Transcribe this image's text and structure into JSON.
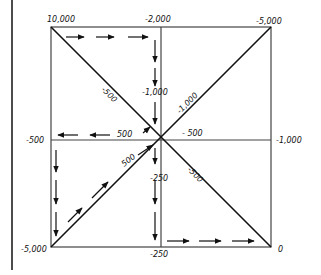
{
  "diagram": {
    "type": "gain-scheduling / value-path grid",
    "corners": {
      "top_left": "10,000",
      "top_right": "-5,000",
      "bottom_left": "-5,000",
      "bottom_right": "0"
    },
    "edge_midpoints": {
      "top": "-2,000",
      "left": "-500",
      "right": "-1,000",
      "bottom": "-250"
    },
    "center_axis_labels": {
      "upper_vertical": "-1,000",
      "lower_vertical": "-250",
      "left_horizontal": "500",
      "right_horizontal": "- 500"
    },
    "diagonal_labels": {
      "top_left": "-500",
      "top_right": "-1,000",
      "bottom_left": "500",
      "bottom_right": "-500"
    },
    "arrow_paths": [
      {
        "name": "top-edge-right",
        "direction": "right",
        "count": 3
      },
      {
        "name": "center-vertical-upper-down",
        "direction": "down",
        "count": 3
      },
      {
        "name": "center-horizontal-left",
        "direction": "left",
        "count": 3
      },
      {
        "name": "left-edge-lower-down",
        "direction": "down",
        "count": 3
      },
      {
        "name": "diagonal-bottom-left-up",
        "direction": "up-right",
        "count": 3
      },
      {
        "name": "center-vertical-lower-down",
        "direction": "down",
        "count": 3
      },
      {
        "name": "bottom-edge-right",
        "direction": "right",
        "count": 3
      }
    ],
    "colors": {
      "ink": "#111111",
      "grid": "#444444",
      "background": "#ffffff"
    }
  }
}
